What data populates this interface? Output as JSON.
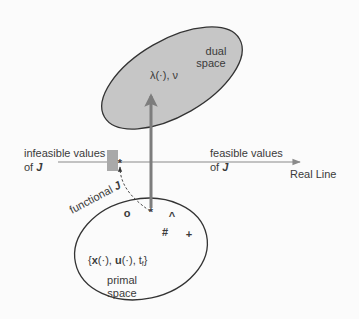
{
  "diagram": {
    "colors": {
      "background": "#fbfbfb",
      "ellipse_fill": "#c6c6c6",
      "ellipse_stroke": "#333333",
      "line": "#8a8a8a",
      "infeasible_block": "#a9a9a9",
      "text": "#3a3a3a"
    },
    "dual_space": {
      "label_line1": "dual",
      "label_line2": "space",
      "multipliers": "λ(·), ν"
    },
    "primal_space": {
      "label_line1": "primal",
      "label_line2": "space",
      "elements": {
        "open": "{",
        "x": "x",
        "x_arg": "(·), ",
        "u": "u",
        "u_arg": "(·), ",
        "t": "t",
        "t_sub": "f",
        "close": "}"
      },
      "points": [
        {
          "symbol": "o",
          "name": "point-o"
        },
        {
          "symbol": "*",
          "name": "point-optimal"
        },
        {
          "symbol": "^",
          "name": "point-caret"
        },
        {
          "symbol": "#",
          "name": "point-hash"
        },
        {
          "symbol": "+",
          "name": "point-plus"
        }
      ]
    },
    "real_line": {
      "label": "Real Line",
      "infeasible_line1": "infeasible values",
      "infeasible_of": "of ",
      "feasible_line1": "feasible values",
      "feasible_of": "of ",
      "J": "J",
      "optimum_marker": "*"
    },
    "functional": {
      "label": "functional ",
      "J": "J"
    }
  }
}
